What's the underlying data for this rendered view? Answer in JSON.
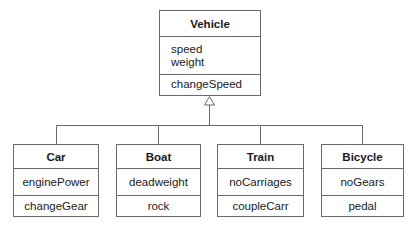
{
  "diagram": {
    "type": "UML class diagram (generalization)",
    "parent": {
      "name": "Vehicle",
      "attributes": [
        "speed",
        "weight"
      ],
      "operations": [
        "changeSpeed"
      ]
    },
    "children": [
      {
        "name": "Car",
        "attributes": [
          "enginePower"
        ],
        "operations": [
          "changeGear"
        ]
      },
      {
        "name": "Boat",
        "attributes": [
          "deadweight"
        ],
        "operations": [
          "rock"
        ]
      },
      {
        "name": "Train",
        "attributes": [
          "noCarriages"
        ],
        "operations": [
          "coupleCarr"
        ]
      },
      {
        "name": "Bicycle",
        "attributes": [
          "noGears"
        ],
        "operations": [
          "pedal"
        ]
      }
    ],
    "relationship": "inheritance",
    "colors": {
      "line": "#6a6a6a",
      "text": "#1a1a1a",
      "background": "#ffffff"
    }
  }
}
